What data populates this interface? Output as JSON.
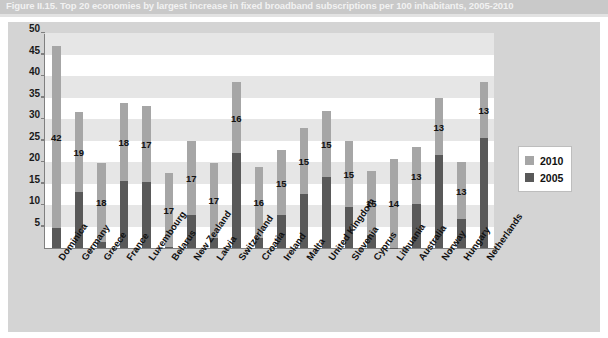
{
  "figure": {
    "title": "Figure II.15.  Top 20 economies by largest increase in fixed broadband subscriptions per 100 inhabitants, 2005-2010"
  },
  "legend": {
    "position": "right",
    "items": [
      {
        "label": "2010",
        "color": "#a6a6a6"
      },
      {
        "label": "2005",
        "color": "#595959"
      }
    ]
  },
  "axis": {
    "y_ticks": [
      "50",
      "45",
      "40",
      "35",
      "30",
      "25",
      "20",
      "15",
      "10",
      "5"
    ]
  },
  "chart_data": {
    "type": "bar",
    "stacked": true,
    "title": "Figure II.15.  Top 20 economies by largest increase in fixed broadband subscriptions per 100 inhabitants, 2005-2010",
    "xlabel": "",
    "ylabel": "",
    "ylim": [
      0,
      50
    ],
    "ytick_step": 5,
    "grid": "horizontal-bands",
    "legend_position": "right",
    "categories": [
      "Dominica",
      "Germany",
      "Greece",
      "France",
      "Luxembourg",
      "Belarus",
      "New Zealand",
      "Latvia",
      "Switzerland",
      "Croatia",
      "Ireland",
      "Malta",
      "United Kingdom",
      "Slovenia",
      "Cyprus",
      "Lithuania",
      "Australia",
      "Norway",
      "Hungary",
      "Netherlands"
    ],
    "series": [
      {
        "name": "2005",
        "color": "#595959",
        "values": [
          4.6,
          13.0,
          1.4,
          15.6,
          15.4,
          0.2,
          7.7,
          2.4,
          22.2,
          2.4,
          7.6,
          12.5,
          16.5,
          9.6,
          3.0,
          0.1,
          10.2,
          21.6,
          6.7,
          25.5
        ]
      },
      {
        "name": "2010",
        "color": "#a6a6a6",
        "values": [
          47.0,
          31.6,
          19.8,
          33.8,
          33.0,
          17.5,
          25.0,
          19.8,
          38.5,
          18.8,
          22.8,
          27.8,
          31.8,
          24.8,
          18.0,
          20.8,
          23.4,
          34.8,
          19.9,
          38.5
        ]
      }
    ],
    "data_labels": {
      "description": "increase in subscriptions per 100 inhabitants, 2005-2010",
      "values": [
        42,
        19,
        18,
        18,
        17,
        17,
        17,
        17,
        16,
        16,
        15,
        15,
        15,
        15,
        15,
        14,
        13,
        13,
        13,
        13
      ]
    }
  }
}
